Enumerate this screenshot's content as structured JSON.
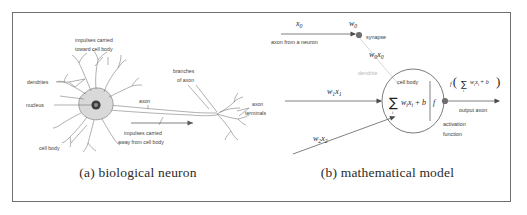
{
  "figure": {
    "panels": [
      {
        "id": "biological",
        "caption": "(a) biological neuron",
        "labels": {
          "impulses_toward_line1": "impulses carried",
          "impulses_toward_line2": "toward cell body",
          "dendrites": "dendrites",
          "nucleus": "nucleus",
          "cell_body": "cell body",
          "axon": "axon",
          "impulses_away_line1": "impulses carried",
          "impulses_away_line2": "away from cell body",
          "branches_line1": "branches",
          "branches_line2": "of axon",
          "terminals_line1": "axon",
          "terminals_line2": "terminals"
        }
      },
      {
        "id": "mathematical",
        "caption": "(b) mathematical model",
        "labels": {
          "input_x0": "x",
          "input_x0_sub": "0",
          "weight_w0": "w",
          "weight_w0_sub": "0",
          "axon_from_neuron": "axon from a neuron",
          "synapse": "synapse",
          "product_w0x0": "w",
          "product_w0x0_sub0": "0",
          "product_w0x0_x": "x",
          "product_w0x0_sub1": "0",
          "dendrite": "dendrite",
          "input_w1x1_w": "w",
          "input_w1x1_sub1": "1",
          "input_w1x1_x": "x",
          "input_w1x1_sub2": "1",
          "input_w2x2_w": "w",
          "input_w2x2_sub1": "2",
          "input_w2x2_x": "x",
          "input_w2x2_sub2": "2",
          "cell_body": "cell body",
          "sigma": "∑",
          "sigma_index": "i",
          "sum_body": "w",
          "sum_body_sub1": "i",
          "sum_body_x": "x",
          "sum_body_sub2": "i",
          "sum_plus_b": "+ b",
          "f_symbol": "f",
          "output_f": "f",
          "output_paren_open": "(",
          "output_sigma": "∑",
          "output_sigma_index": "i",
          "output_w": "w",
          "output_w_sub": "i",
          "output_x": "x",
          "output_x_sub": "i",
          "output_plus_b": "+ b",
          "output_paren_close": ")",
          "output_axon": "output axon",
          "activation_line1": "activation",
          "activation_line2": "function"
        }
      }
    ]
  },
  "colors": {
    "frame_border": "#6f6f6f",
    "background": "#ffffff",
    "label_text": "#3a3a3a",
    "faint_text": "#b9b9b9",
    "math_text": "#1f1f1f",
    "line": "#4a4a4a",
    "soma_fill": "#d9d9d9"
  }
}
